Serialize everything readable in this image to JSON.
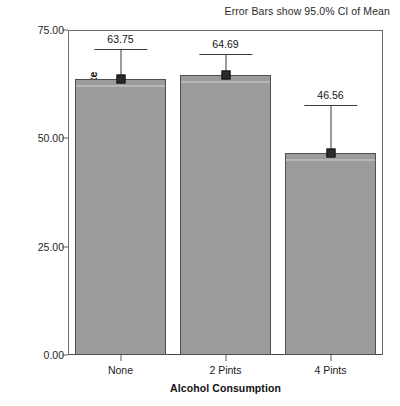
{
  "chart_data": {
    "type": "bar",
    "title": "",
    "annotation": "Error Bars show 95.0% CI of Mean",
    "xlabel": "Alcohol Consumption",
    "ylabel": "Attractiveness of Date",
    "categories": [
      "None",
      "2 Pints",
      "4 Pints"
    ],
    "values": [
      63.75,
      64.69,
      46.56
    ],
    "value_labels": [
      "63.75",
      "64.69",
      "46.56"
    ],
    "error_bars": {
      "kind": "95.0% CI of Mean",
      "upper": [
        70.6,
        69.4,
        57.6
      ],
      "lower": [
        63.75,
        64.69,
        46.56
      ]
    },
    "ylim": [
      0.0,
      75.0
    ],
    "yticks": [
      0.0,
      25.0,
      50.0,
      75.0
    ],
    "ytick_labels": [
      "0.00",
      "25.00",
      "50.00",
      "75.00"
    ],
    "grid": false,
    "legend": false,
    "bar_color": "#9b9b9b",
    "bar_edge_color": "#4f4f4f",
    "error_color": "#3a3a3a",
    "axis_color": "#5c5c5c",
    "background": "#ffffff"
  }
}
